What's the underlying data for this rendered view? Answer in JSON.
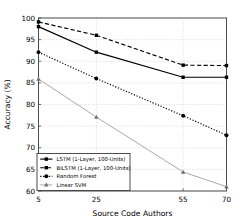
{
  "chart_data": {
    "type": "line",
    "title": "",
    "xlabel": "Source Code Authors",
    "ylabel": "Accuracy (%)",
    "x": [
      5,
      25,
      55,
      70
    ],
    "xticks": [
      "5",
      "25",
      "55",
      "70"
    ],
    "yticks": [
      "60",
      "65",
      "70",
      "75",
      "80",
      "85",
      "90",
      "95",
      "100"
    ],
    "xlim": [
      5,
      70
    ],
    "ylim": [
      60,
      100
    ],
    "grid": true,
    "legend_position": "lower-left",
    "series": [
      {
        "name": "LSTM (1-Layer, 100-Units)",
        "values": [
          98.0,
          92.1,
          86.3,
          86.3
        ],
        "marker": "square",
        "linestyle": "solid",
        "color": "#000000"
      },
      {
        "name": "BiLSTM (1-Layer, 100-Units)",
        "values": [
          99.1,
          96.0,
          89.1,
          89.0
        ],
        "marker": "square",
        "linestyle": "dashed",
        "color": "#000000"
      },
      {
        "name": "Random Forest",
        "values": [
          92.1,
          86.0,
          77.4,
          72.9
        ],
        "marker": "circle",
        "linestyle": "dotted",
        "color": "#000000"
      },
      {
        "name": "Linear SVM",
        "values": [
          85.9,
          77.1,
          64.4,
          61.0
        ],
        "marker": "triangle",
        "linestyle": "solid-light",
        "color": "#999999"
      }
    ]
  }
}
